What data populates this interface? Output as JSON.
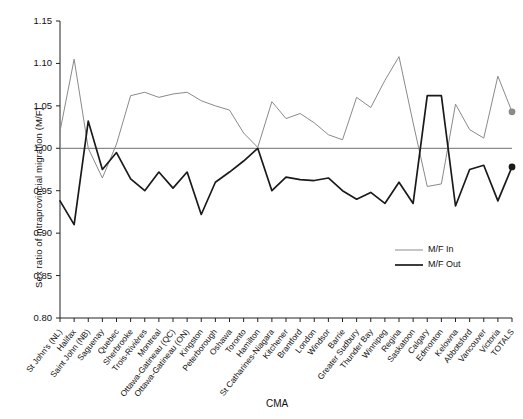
{
  "chart_data": {
    "type": "line",
    "title": "",
    "xlabel": "CMA",
    "ylabel": "Sex ratio of intraprovincial migration (M/F)",
    "ylim": [
      0.8,
      1.15
    ],
    "ytick_labels": [
      "0.80",
      "0.85",
      "0.90",
      "0.95",
      "1.00",
      "1.05",
      "1.10",
      "1.15"
    ],
    "ytick_values": [
      0.8,
      0.85,
      0.9,
      0.95,
      1.0,
      1.05,
      1.1,
      1.15
    ],
    "grid": false,
    "reference_line": 1.0,
    "legend_position": "lower-right",
    "categories": [
      "St John's (NL)",
      "Halifax",
      "Saint John (NB)",
      "Saguenay",
      "Quebec",
      "Sherbrooke",
      "Trois-Rivières",
      "Montreal",
      "Ottawa-Gatineau (QC)",
      "Ottawa-Gatineau (ON)",
      "Kingston",
      "Peterborough",
      "Oshawa",
      "Toronto",
      "Hamilton",
      "St Catharines-Niagara",
      "Kitchener",
      "Brantford",
      "London",
      "Windsor",
      "Barrie",
      "Greater Sudbury",
      "Thunder Bay",
      "Winnipeg",
      "Regina",
      "Saskatoon",
      "Calgary",
      "Edmonton",
      "Kelowna",
      "Abbotsford",
      "Vancouver",
      "Victoria",
      "TOTALS"
    ],
    "series": [
      {
        "name": "M/F In",
        "color": "#8a8a8a",
        "values": [
          1.02,
          1.105,
          1.0,
          0.965,
          1.005,
          1.062,
          1.066,
          1.06,
          1.064,
          1.066,
          1.056,
          1.05,
          1.045,
          1.018,
          1.001,
          1.055,
          1.035,
          1.041,
          1.03,
          1.016,
          1.01,
          1.06,
          1.048,
          1.08,
          1.108,
          1.03,
          0.955,
          0.958,
          1.052,
          1.022,
          1.012,
          1.085,
          1.043
        ],
        "endpoint_marker": true,
        "endpoint_value": 1.043
      },
      {
        "name": "M/F Out",
        "color": "#1a1a1a",
        "values": [
          0.938,
          0.91,
          1.032,
          0.975,
          0.995,
          0.964,
          0.95,
          0.972,
          0.953,
          0.972,
          0.922,
          0.96,
          0.972,
          0.985,
          1.0,
          0.95,
          0.966,
          0.963,
          0.962,
          0.965,
          0.95,
          0.94,
          0.948,
          0.935,
          0.96,
          0.935,
          1.062,
          1.062,
          0.932,
          0.975,
          0.98,
          0.938,
          0.978
        ],
        "endpoint_marker": true,
        "endpoint_value": 0.978
      }
    ]
  },
  "legend": {
    "items": [
      {
        "label": "M/F In"
      },
      {
        "label": "M/F Out"
      }
    ]
  },
  "axis": {
    "x_title": "CMA",
    "y_title": "Sex ratio of intraprovincial migration (M/F)"
  }
}
